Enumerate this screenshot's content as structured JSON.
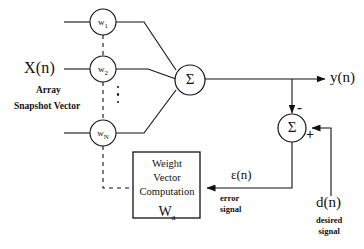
{
  "diagram": {
    "input_label": "X(n)",
    "input_sublabel_line1": "Array",
    "input_sublabel_line2": "Snapshot Vector",
    "output_label": "y(n)",
    "desired_label": "d(n)",
    "desired_sub_line1": "desired",
    "desired_sub_line2": "signal",
    "error_label": "ε(n)",
    "error_sub_line1": "error",
    "error_sub_line2": "signal",
    "sum_symbol": "Σ",
    "plus_sign": "+",
    "minus_sign": "-",
    "ellipsis_dots": 3,
    "weights": [
      {
        "name": "w1",
        "base": "w",
        "sub": "1"
      },
      {
        "name": "w2",
        "base": "w",
        "sub": "2"
      },
      {
        "name": "wN",
        "base": "w",
        "sub": "N"
      }
    ],
    "computation_box": {
      "line1": "Weight",
      "line2": "Vector",
      "line3": "Computation",
      "symbol_base": "W",
      "symbol_sub": "a"
    },
    "colors": {
      "stroke": "#111111",
      "background": "#ffffff",
      "node_fill": "#ffffff"
    }
  }
}
